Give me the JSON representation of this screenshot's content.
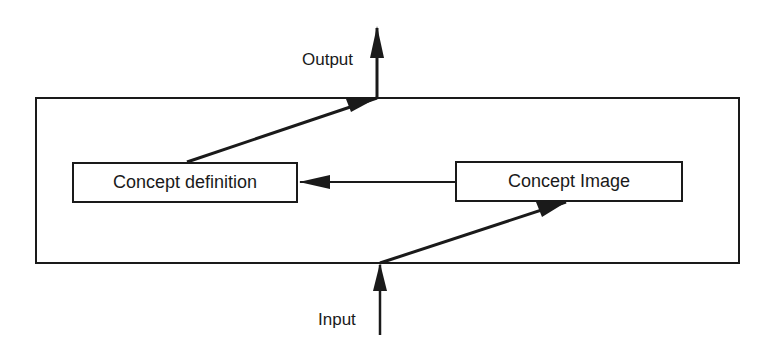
{
  "diagram": {
    "labels": {
      "output": "Output",
      "input": "Input"
    },
    "nodes": [
      {
        "id": "concept-definition",
        "label": "Concept definition"
      },
      {
        "id": "concept-image",
        "label": "Concept Image"
      }
    ],
    "edges": [
      {
        "from": "input",
        "to": "concept-image"
      },
      {
        "from": "concept-image",
        "to": "concept-definition"
      },
      {
        "from": "concept-definition",
        "to": "output"
      }
    ],
    "colors": {
      "stroke": "#1a1a1a",
      "background": "#ffffff"
    }
  }
}
